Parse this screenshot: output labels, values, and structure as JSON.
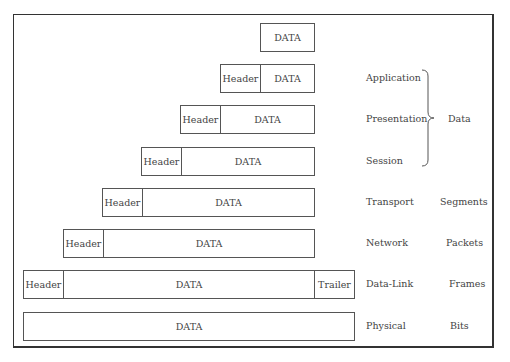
{
  "header_label": "Header",
  "data_label": "DATA",
  "trailer_label": "Trailer",
  "rows": [
    {
      "layer": "",
      "pdu": "",
      "header": false,
      "trailer": false
    },
    {
      "layer": "Application",
      "pdu": "",
      "header": true,
      "trailer": false
    },
    {
      "layer": "Presentation",
      "pdu": "",
      "header": true,
      "trailer": false
    },
    {
      "layer": "Session",
      "pdu": "",
      "header": true,
      "trailer": false
    },
    {
      "layer": "Transport",
      "pdu": "Segments",
      "header": true,
      "trailer": false
    },
    {
      "layer": "Network",
      "pdu": "Packets",
      "header": true,
      "trailer": false
    },
    {
      "layer": "Data-Link",
      "pdu": "Frames",
      "header": true,
      "trailer": true
    },
    {
      "layer": "Physical",
      "pdu": "Bits",
      "header": false,
      "trailer": false
    }
  ],
  "brace_label": "Data"
}
